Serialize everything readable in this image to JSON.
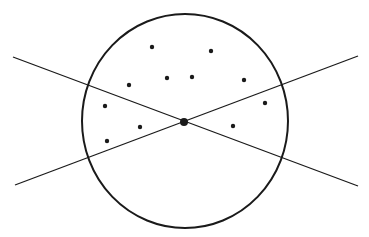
{
  "diagram": {
    "width": 369,
    "height": 237,
    "background": "#ffffff",
    "stroke_color": "#1a1a1a",
    "circle": {
      "cx": 185,
      "cy": 121,
      "rx": 103,
      "ry": 107,
      "stroke_width": 2
    },
    "lines": [
      {
        "x1": 13,
        "y1": 57,
        "x2": 358,
        "y2": 186,
        "stroke_width": 1.3
      },
      {
        "x1": 15,
        "y1": 185,
        "x2": 358,
        "y2": 56,
        "stroke_width": 1.3
      }
    ],
    "center_point": {
      "cx": 184,
      "cy": 122,
      "r": 4
    },
    "points": [
      {
        "cx": 152,
        "cy": 47
      },
      {
        "cx": 211,
        "cy": 51
      },
      {
        "cx": 167,
        "cy": 78
      },
      {
        "cx": 192,
        "cy": 77
      },
      {
        "cx": 244,
        "cy": 80
      },
      {
        "cx": 129,
        "cy": 85
      },
      {
        "cx": 265,
        "cy": 103
      },
      {
        "cx": 105,
        "cy": 106
      },
      {
        "cx": 140,
        "cy": 127
      },
      {
        "cx": 233,
        "cy": 126
      },
      {
        "cx": 107,
        "cy": 141
      }
    ],
    "point_radius": 2.2
  }
}
